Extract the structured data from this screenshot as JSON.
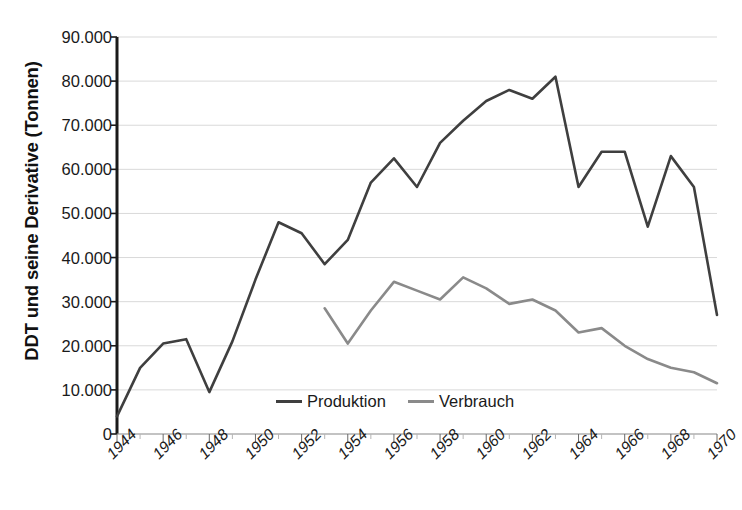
{
  "chart_data": {
    "type": "line",
    "title": "",
    "xlabel": "",
    "ylabel": "DDT und seine Derivative (Tonnen)",
    "xlim": [
      1944,
      1970
    ],
    "ylim": [
      0,
      90000
    ],
    "grid": true,
    "legend_position": "inside-bottom-center",
    "y_ticks": [
      "0",
      "10.000",
      "20.000",
      "30.000",
      "40.000",
      "50.000",
      "60.000",
      "70.000",
      "80.000",
      "90.000"
    ],
    "y_tick_values": [
      0,
      10000,
      20000,
      30000,
      40000,
      50000,
      60000,
      70000,
      80000,
      90000
    ],
    "x_ticks": [
      "1944",
      "1946",
      "1948",
      "1950",
      "1952",
      "1954",
      "1956",
      "1958",
      "1960",
      "1962",
      "1964",
      "1966",
      "1968",
      "1970"
    ],
    "x_tick_values": [
      1944,
      1946,
      1948,
      1950,
      1952,
      1954,
      1956,
      1958,
      1960,
      1962,
      1964,
      1966,
      1968,
      1970
    ],
    "x": [
      1944,
      1945,
      1946,
      1947,
      1948,
      1949,
      1950,
      1951,
      1952,
      1953,
      1954,
      1955,
      1956,
      1957,
      1958,
      1959,
      1960,
      1961,
      1962,
      1963,
      1964,
      1965,
      1966,
      1967,
      1968,
      1969,
      1970
    ],
    "series": [
      {
        "name": "Produktion",
        "color": "#3f3f3f",
        "x": [
          1944,
          1945,
          1946,
          1947,
          1948,
          1949,
          1950,
          1951,
          1952,
          1953,
          1954,
          1955,
          1956,
          1957,
          1958,
          1959,
          1960,
          1961,
          1962,
          1963,
          1964,
          1965,
          1966,
          1967,
          1968,
          1969,
          1970
        ],
        "values": [
          4000,
          15000,
          20500,
          21500,
          9500,
          21000,
          35000,
          48000,
          45500,
          38500,
          44000,
          57000,
          62500,
          56000,
          66000,
          71000,
          75500,
          78000,
          76000,
          81000,
          56000,
          64000,
          64000,
          47000,
          63000,
          56000,
          27000
        ]
      },
      {
        "name": "Verbrauch",
        "color": "#8a8a8a",
        "x": [
          1953,
          1954,
          1955,
          1956,
          1957,
          1958,
          1959,
          1960,
          1961,
          1962,
          1963,
          1964,
          1965,
          1966,
          1967,
          1968,
          1969,
          1970
        ],
        "values": [
          28500,
          20500,
          28000,
          34500,
          32500,
          30500,
          35500,
          33000,
          29500,
          30500,
          28000,
          23000,
          24000,
          20000,
          17000,
          15000,
          14000,
          11500
        ]
      }
    ]
  },
  "legend": {
    "items": [
      {
        "label": "Produktion",
        "color": "#3f3f3f"
      },
      {
        "label": "Verbrauch",
        "color": "#8a8a8a"
      }
    ]
  },
  "axis": {
    "y_title": "DDT und seine Derivative (Tonnen)"
  }
}
